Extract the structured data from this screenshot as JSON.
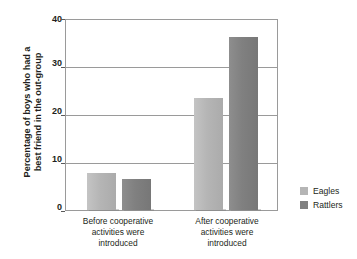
{
  "chart_data": {
    "type": "bar",
    "title": "",
    "xlabel": "",
    "ylabel": "Percentage of boys who had a best friend in the out-group",
    "ylabel_lines": [
      "Percentage of boys who had a",
      "best friend in the out-group"
    ],
    "categories": [
      "Before cooperative activities were introduced",
      "After cooperative activities were introduced"
    ],
    "category_lines": [
      [
        "Before cooperative",
        "activities were",
        "introduced"
      ],
      [
        "After cooperative",
        "activities were",
        "introduced"
      ]
    ],
    "series": [
      {
        "name": "Eagles",
        "color": "#b5b5b5",
        "values": [
          7.8,
          23.5
        ]
      },
      {
        "name": "Rattlers",
        "color": "#808080",
        "values": [
          6.5,
          36.5
        ]
      }
    ],
    "ylim": [
      0,
      40
    ],
    "yticks": [
      0,
      10,
      20,
      30,
      40
    ],
    "ytick_labels": [
      "0",
      "10",
      "20",
      "30",
      "40"
    ],
    "grid": true,
    "gridlines_at": [
      10,
      20,
      30
    ],
    "legend_position": "right",
    "legend": [
      "Eagles",
      "Rattlers"
    ]
  },
  "axis": {
    "tick_0": "0",
    "tick_10": "10",
    "tick_20": "20",
    "tick_30": "30",
    "tick_40": "40"
  },
  "ylabel": {
    "line1": "Percentage of boys who had a",
    "line2": "best friend in the out-group"
  },
  "categories": {
    "g1l1": "Before cooperative",
    "g1l2": "activities were",
    "g1l3": "introduced",
    "g2l1": "After cooperative",
    "g2l2": "activities were",
    "g2l3": "introduced"
  },
  "legend": {
    "eagles": "Eagles",
    "rattlers": "Rattlers"
  }
}
